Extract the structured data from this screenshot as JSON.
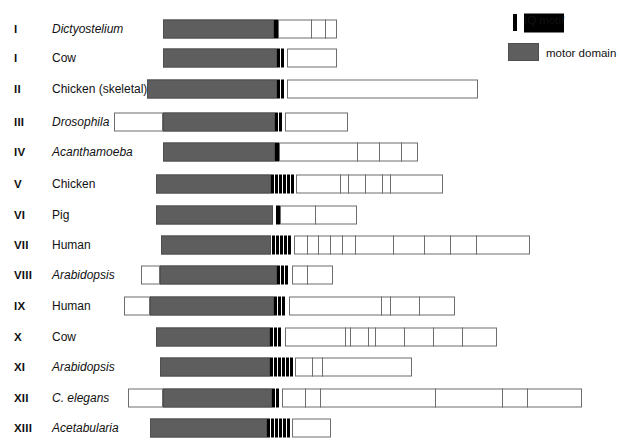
{
  "figure": {
    "scale_note": "Horizontal extent represents polypeptide length"
  },
  "legend": {
    "position": "top-right",
    "items": [
      {
        "key": "iq",
        "label": "IQ motif",
        "color": "#000000",
        "swatch": "narrow-black-bar"
      },
      {
        "key": "motor",
        "label": "motor domain",
        "color": "#5e5e5e",
        "swatch": "gray-rectangle"
      }
    ]
  },
  "colors": {
    "motor_domain": "#5e5e5e",
    "iq_motif": "#000000",
    "tail_fill": "#ffffff",
    "outline": "#6d6d6d",
    "background": "#ffffff",
    "text": "#111111"
  },
  "columns": [
    "class",
    "organism",
    "domain-structure"
  ],
  "rows": [
    {
      "class": "I",
      "organism": "Dictyostelium",
      "italic": true,
      "y": 16,
      "nterm": null,
      "motor": {
        "x": 163,
        "w": 111
      },
      "iq_count": 1,
      "iq_x": 274,
      "iq_w": 4,
      "tail": {
        "x": 278,
        "w": 59
      },
      "tail_dividers": [
        311,
        325
      ]
    },
    {
      "class": "I",
      "organism": "Cow",
      "italic": false,
      "y": 45,
      "nterm": null,
      "motor": {
        "x": 163,
        "w": 114
      },
      "iq_count": 2,
      "iq_x": 277,
      "iq_w": 3,
      "tail": {
        "x": 287,
        "w": 50
      },
      "tail_dividers": []
    },
    {
      "class": "II",
      "organism": "Chicken (skeletal)",
      "italic": false,
      "y": 76,
      "nterm": null,
      "motor": {
        "x": 147,
        "w": 130
      },
      "iq_count": 2,
      "iq_x": 277,
      "iq_w": 3,
      "tail": {
        "x": 287,
        "w": 191
      },
      "tail_dividers": []
    },
    {
      "class": "III",
      "organism": "Drosophila",
      "italic": true,
      "y": 109,
      "nterm": {
        "x": 114,
        "w": 49
      },
      "motor": {
        "x": 163,
        "w": 112
      },
      "iq_count": 2,
      "iq_x": 275,
      "iq_w": 3,
      "tail": {
        "x": 285,
        "w": 63
      },
      "tail_dividers": []
    },
    {
      "class": "IV",
      "organism": "Acanthamoeba",
      "italic": true,
      "y": 139,
      "nterm": null,
      "motor": {
        "x": 163,
        "w": 112
      },
      "iq_count": 1,
      "iq_x": 275,
      "iq_w": 4,
      "tail": {
        "x": 279,
        "w": 139
      },
      "tail_dividers": [
        357,
        379,
        401
      ]
    },
    {
      "class": "V",
      "organism": "Chicken",
      "italic": false,
      "y": 171,
      "nterm": null,
      "motor": {
        "x": 156,
        "w": 115
      },
      "iq_count": 6,
      "iq_x": 271,
      "iq_w": 3,
      "tail": {
        "x": 296,
        "w": 147
      },
      "tail_dividers": [
        340,
        348,
        365,
        382,
        390
      ]
    },
    {
      "class": "VI",
      "organism": "Pig",
      "italic": false,
      "y": 202,
      "nterm": null,
      "motor": {
        "x": 156,
        "w": 117
      },
      "iq_count": 1,
      "iq_x": 276,
      "iq_w": 4,
      "tail": {
        "x": 280,
        "w": 77
      },
      "tail_dividers": [
        315
      ]
    },
    {
      "class": "VII",
      "organism": "Human",
      "italic": false,
      "y": 232,
      "nterm": null,
      "motor": {
        "x": 161,
        "w": 110
      },
      "iq_count": 5,
      "iq_x": 272,
      "iq_w": 3,
      "tail": {
        "x": 294,
        "w": 236
      },
      "tail_dividers": [
        307,
        318,
        330,
        342,
        355,
        393,
        424,
        450,
        476
      ]
    },
    {
      "class": "VIII",
      "organism": "Arabidopsis",
      "italic": true,
      "y": 262,
      "nterm": {
        "x": 141,
        "w": 19
      },
      "motor": {
        "x": 160,
        "w": 117
      },
      "iq_count": 3,
      "iq_x": 277,
      "iq_w": 3,
      "tail": {
        "x": 292,
        "w": 41
      },
      "tail_dividers": [
        307
      ]
    },
    {
      "class": "IX",
      "organism": "Human",
      "italic": false,
      "y": 293,
      "nterm": {
        "x": 124,
        "w": 26
      },
      "motor": {
        "x": 150,
        "w": 124
      },
      "iq_count": 3,
      "iq_x": 274,
      "iq_w": 3,
      "tail": {
        "x": 289,
        "w": 166
      },
      "tail_dividers": [
        381,
        390,
        419
      ]
    },
    {
      "class": "X",
      "organism": "Cow",
      "italic": false,
      "y": 324,
      "nterm": null,
      "motor": {
        "x": 156,
        "w": 114
      },
      "iq_count": 3,
      "iq_x": 270,
      "iq_w": 3,
      "tail": {
        "x": 285,
        "w": 212
      },
      "tail_dividers": [
        345,
        350,
        368,
        375,
        404,
        433,
        462
      ]
    },
    {
      "class": "XI",
      "organism": "Arabidopsis",
      "italic": true,
      "y": 354,
      "nterm": null,
      "motor": {
        "x": 160,
        "w": 110
      },
      "iq_count": 6,
      "iq_x": 270,
      "iq_w": 3,
      "tail": {
        "x": 295,
        "w": 117
      },
      "tail_dividers": [
        312,
        322
      ]
    },
    {
      "class": "XII",
      "organism": "C. elegans",
      "italic": true,
      "y": 385,
      "nterm": {
        "x": 128,
        "w": 35
      },
      "motor": {
        "x": 163,
        "w": 109
      },
      "iq_count": 2,
      "iq_x": 272,
      "iq_w": 3,
      "tail": {
        "x": 282,
        "w": 300
      },
      "tail_dividers": [
        305,
        320,
        435,
        502,
        527
      ]
    },
    {
      "class": "XIII",
      "organism": "Acetabularia",
      "italic": true,
      "y": 415,
      "nterm": null,
      "motor": {
        "x": 150,
        "w": 117
      },
      "iq_count": 6,
      "iq_x": 267,
      "iq_w": 3,
      "tail": {
        "x": 292,
        "w": 39
      },
      "tail_dividers": []
    }
  ]
}
